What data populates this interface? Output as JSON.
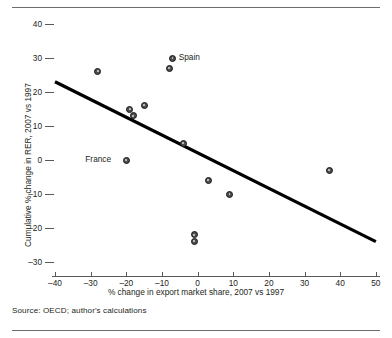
{
  "figure": {
    "source_note": "Source: OECD; author's calculations"
  },
  "chart_data": {
    "type": "scatter",
    "title": "",
    "xlabel": "% change in export market share, 2007 vs 1997",
    "ylabel": "Cumulative % change in RER, 2007 vs 1997",
    "xlim": [
      -40,
      50
    ],
    "ylim": [
      -30,
      40
    ],
    "xticks": [
      -40,
      -30,
      -20,
      -10,
      0,
      10,
      20,
      30,
      40,
      50
    ],
    "yticks": [
      40,
      30,
      20,
      10,
      0,
      -10,
      -20,
      -30
    ],
    "xtick_labels": [
      "–40",
      "–30",
      "–20",
      "–10",
      "0",
      "10",
      "20",
      "30",
      "40",
      "50"
    ],
    "ytick_labels": [
      "40",
      "30",
      "20",
      "10",
      "0",
      "–10",
      "–20",
      "–30"
    ],
    "grid": false,
    "legend": "none",
    "marker_color": "#4d4d4f",
    "trendline_color": "#000000",
    "points": [
      {
        "x": -28,
        "y": 26,
        "label": ""
      },
      {
        "x": -7,
        "y": 30,
        "label": "Spain"
      },
      {
        "x": -8,
        "y": 27,
        "label": ""
      },
      {
        "x": -19,
        "y": 15,
        "label": ""
      },
      {
        "x": -18,
        "y": 13,
        "label": ""
      },
      {
        "x": -15,
        "y": 16,
        "label": ""
      },
      {
        "x": -4,
        "y": 5,
        "label": ""
      },
      {
        "x": -20,
        "y": 0,
        "label": "France"
      },
      {
        "x": 3,
        "y": -6,
        "label": ""
      },
      {
        "x": 9,
        "y": -10,
        "label": ""
      },
      {
        "x": -1,
        "y": -22,
        "label": ""
      },
      {
        "x": -1,
        "y": -24,
        "label": ""
      },
      {
        "x": 37,
        "y": -3,
        "label": ""
      }
    ],
    "trendline": {
      "x0": -40,
      "y0": 23,
      "x1": 50,
      "y1": -24
    }
  }
}
